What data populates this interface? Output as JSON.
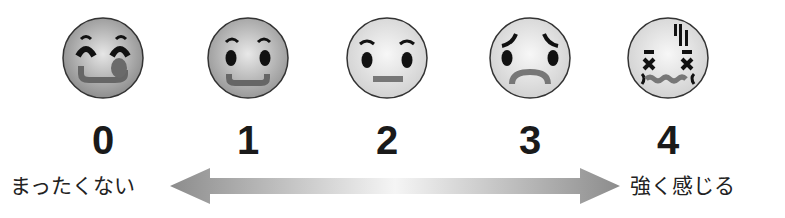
{
  "scale": {
    "items": [
      {
        "value": "0",
        "face": "delighted-face-tongue",
        "fill": "#9a9a9a"
      },
      {
        "value": "1",
        "face": "smiling-face",
        "fill": "#a8a8a8"
      },
      {
        "value": "2",
        "face": "neutral-face",
        "fill": "#dcdcdc"
      },
      {
        "value": "3",
        "face": "sad-worried-face",
        "fill": "#dcdcdc"
      },
      {
        "value": "4",
        "face": "distressed-face",
        "fill": "#e2e2e2"
      }
    ],
    "left_label": "まったくない",
    "right_label": "強く感じる",
    "arrow": {
      "direction": "both",
      "color_ends": "#8f8f8f",
      "color_center": "#f5f5f5"
    }
  }
}
